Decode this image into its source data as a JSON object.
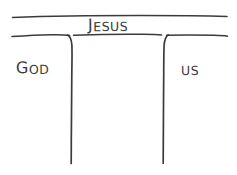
{
  "diagram": {
    "title_label": "JESUS",
    "left_label": "GOD",
    "right_label": "US",
    "labels": [
      {
        "id": "top",
        "text": "JESUS",
        "lead": "J",
        "rest": "ESUS"
      },
      {
        "id": "left",
        "text": "GOD",
        "lead": "G",
        "rest": "OD"
      },
      {
        "id": "right",
        "text": "US",
        "lead": "U",
        "rest": "S"
      }
    ],
    "ink_color": "#3b3b3b",
    "background_color": "#ffffff",
    "style": "hand-drawn sketch",
    "shape": "table with two legs / bridge",
    "strokes": {
      "top_rule": "horizontal line near top edge",
      "second_rule": "horizontal line below the title",
      "left_leg": "vertical line curving down from left of the bar",
      "right_leg": "vertical line curving down from right of the bar"
    }
  }
}
